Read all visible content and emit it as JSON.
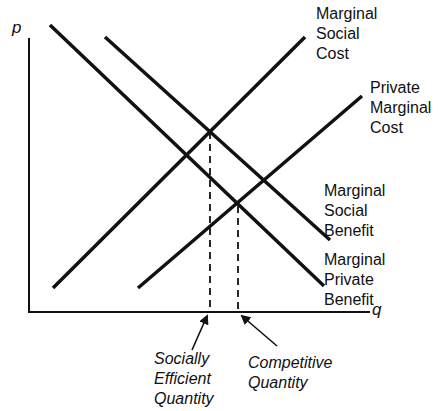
{
  "axes": {
    "y_label": "p",
    "x_label": "q"
  },
  "curves": {
    "marginal_social_cost": {
      "lines": [
        "Marginal",
        "Social",
        "Cost"
      ]
    },
    "private_marginal_cost": {
      "lines": [
        "Private",
        "Marginal",
        "Cost"
      ]
    },
    "marginal_social_benefit": {
      "lines": [
        "Marginal",
        "Social",
        "Benefit"
      ]
    },
    "marginal_private_benefit": {
      "lines": [
        "Marginal",
        "Private",
        "Benefit"
      ]
    }
  },
  "annotations": {
    "socially_efficient": {
      "lines": [
        "Socially",
        "Efficient",
        "Quantity"
      ]
    },
    "competitive": {
      "lines": [
        "Competitive",
        "Quantity"
      ]
    }
  },
  "colors": {
    "line": "#111111",
    "background": "#ffffff"
  }
}
